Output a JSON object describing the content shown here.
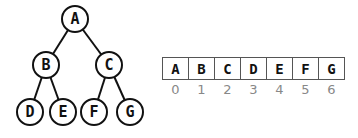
{
  "tree": {
    "nodes": [
      {
        "id": "A",
        "label": "A",
        "cx": 75,
        "cy": 19
      },
      {
        "id": "B",
        "label": "B",
        "cx": 46,
        "cy": 65
      },
      {
        "id": "C",
        "label": "C",
        "cx": 109,
        "cy": 65
      },
      {
        "id": "D",
        "label": "D",
        "cx": 30,
        "cy": 112
      },
      {
        "id": "E",
        "label": "E",
        "cx": 63,
        "cy": 112
      },
      {
        "id": "F",
        "label": "F",
        "cx": 94,
        "cy": 112
      },
      {
        "id": "G",
        "label": "G",
        "cx": 130,
        "cy": 112
      }
    ],
    "edges": [
      [
        "A",
        "B"
      ],
      [
        "A",
        "C"
      ],
      [
        "B",
        "D"
      ],
      [
        "B",
        "E"
      ],
      [
        "C",
        "F"
      ],
      [
        "C",
        "G"
      ]
    ],
    "radius": 13
  },
  "array": {
    "x": 162,
    "y": 57,
    "cell_width": 26,
    "cell_height": 22,
    "cells": [
      {
        "value": "A",
        "index": "0"
      },
      {
        "value": "B",
        "index": "1"
      },
      {
        "value": "C",
        "index": "2"
      },
      {
        "value": "D",
        "index": "3"
      },
      {
        "value": "E",
        "index": "4"
      },
      {
        "value": "F",
        "index": "5"
      },
      {
        "value": "G",
        "index": "6"
      }
    ]
  }
}
